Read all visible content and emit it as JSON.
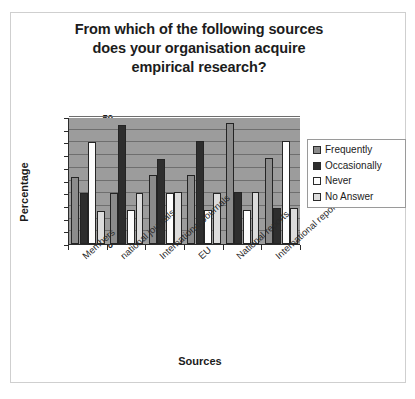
{
  "chart_data": {
    "type": "bar",
    "title": "From which of the following sources does your organisation acquire empirical research?",
    "title_lines": [
      "From which of the following sources",
      "does your organisation acquire",
      "empirical research?"
    ],
    "xlabel": "Sources",
    "ylabel": "Percentage",
    "ylim": [
      0,
      50
    ],
    "yticks": [
      0,
      5,
      10,
      15,
      20,
      25,
      30,
      35,
      40,
      45,
      50
    ],
    "grid": true,
    "legend_position": "right",
    "categories": [
      "Members",
      "national journals",
      "International Journals",
      "EU",
      "National reports",
      "International reports"
    ],
    "series": [
      {
        "name": "Frequently",
        "color": "#8b8b8b",
        "values": [
          26.5,
          20.0,
          27.0,
          27.0,
          47.5,
          34.0
        ]
      },
      {
        "name": "Occasionally",
        "color": "#2e2e2e",
        "values": [
          20.0,
          47.0,
          33.5,
          40.5,
          20.5,
          14.0
        ]
      },
      {
        "name": "Never",
        "color": "#fdfdfd",
        "values": [
          40.0,
          13.5,
          20.0,
          13.5,
          13.5,
          40.5
        ]
      },
      {
        "name": "No Answer",
        "color": "#dcdcdc",
        "values": [
          13.0,
          20.0,
          20.5,
          20.0,
          20.5,
          14.0
        ]
      }
    ]
  }
}
